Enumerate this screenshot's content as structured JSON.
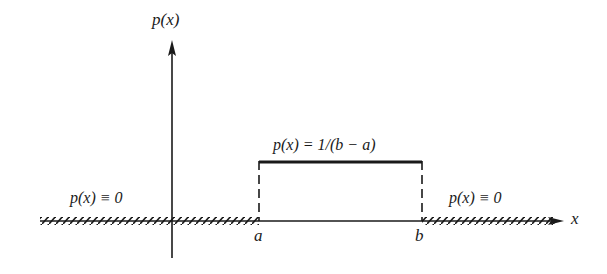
{
  "diagram": {
    "type": "uniform-distribution-pdf",
    "axes": {
      "y_label": "p(x)",
      "x_label": "x"
    },
    "points": {
      "a_label": "a",
      "b_label": "b"
    },
    "annotations": {
      "left_region": "p(x) ≡ 0",
      "middle_region": "p(x) = 1/(b − a)",
      "right_region": "p(x) ≡ 0"
    },
    "colors": {
      "ink": "#1a1a1a",
      "background": "#ffffff"
    }
  }
}
